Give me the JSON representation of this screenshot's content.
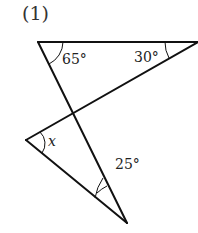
{
  "problem": {
    "number": "(1)"
  },
  "diagram": {
    "angles": {
      "top_left": "65°",
      "top_right": "30°",
      "left": "x",
      "bottom": "25°"
    },
    "stroke_color": "#111111"
  }
}
